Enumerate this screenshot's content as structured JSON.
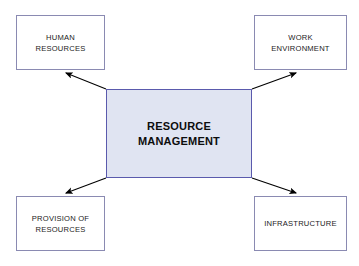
{
  "diagram": {
    "title": "Resource Management",
    "background_color": "#ffffff",
    "center": {
      "id": "resource-management",
      "label": "RESOURCE\nMANAGEMENT",
      "line1": "RESOURCE",
      "line2": "MANAGEMENT",
      "fill_color": "#e0e4f2",
      "border_color": "#5a5aad",
      "text_color": "#0d0d0d"
    },
    "nodes": [
      {
        "id": "human-resources",
        "label": "HUMAN\nRESOURCES",
        "position": "top-left",
        "fill_color": "#ffffff",
        "border_color": "#8a8ab2",
        "text_color": "#1b1b1b"
      },
      {
        "id": "work-environment",
        "label": "WORK\nENVIRONMENT",
        "position": "top-right",
        "fill_color": "#ffffff",
        "border_color": "#8a8ab2",
        "text_color": "#1b1b1b"
      },
      {
        "id": "provision-of-resources",
        "label": "PROVISION OF\nRESOURCES",
        "position": "bottom-left",
        "fill_color": "#ffffff",
        "border_color": "#8a8ab2",
        "text_color": "#1b1b1b"
      },
      {
        "id": "infrastructure",
        "label": "INFRASTRUCTURE",
        "position": "bottom-right",
        "fill_color": "#ffffff",
        "border_color": "#8a8ab2",
        "text_color": "#1b1b1b"
      }
    ],
    "connectors": [
      {
        "id": "connector-to-human-resources",
        "from": "resource-management",
        "to": "human-resources",
        "direction": "up-left",
        "arrowhead": "target",
        "color": "#000000"
      },
      {
        "id": "connector-to-work-environment",
        "from": "resource-management",
        "to": "work-environment",
        "direction": "up-right",
        "arrowhead": "target",
        "color": "#000000"
      },
      {
        "id": "connector-to-provision-of-resources",
        "from": "resource-management",
        "to": "provision-of-resources",
        "direction": "down-left",
        "arrowhead": "target",
        "color": "#000000"
      },
      {
        "id": "connector-to-infrastructure",
        "from": "resource-management",
        "to": "infrastructure",
        "direction": "down-right",
        "arrowhead": "target",
        "color": "#000000"
      }
    ]
  }
}
